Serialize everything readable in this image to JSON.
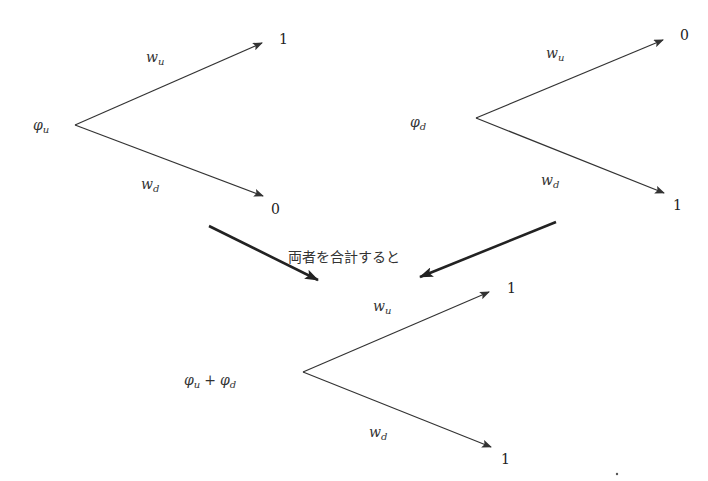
{
  "diagram": {
    "type": "binomial-tree-sum",
    "trees": [
      {
        "id": "tree-phi-u",
        "root_label": "φ",
        "root_sub": "u",
        "up_weight": "w",
        "up_weight_sub": "u",
        "down_weight": "w",
        "down_weight_sub": "d",
        "up_value": "1",
        "down_value": "0"
      },
      {
        "id": "tree-phi-d",
        "root_label": "φ",
        "root_sub": "d",
        "up_weight": "w",
        "up_weight_sub": "u",
        "down_weight": "w",
        "down_weight_sub": "d",
        "up_value": "0",
        "down_value": "1"
      },
      {
        "id": "tree-sum",
        "root_label_a": "φ",
        "root_sub_a": "u",
        "root_plus": "+",
        "root_label_b": "φ",
        "root_sub_b": "d",
        "up_weight": "w",
        "up_weight_sub": "u",
        "down_weight": "w",
        "down_weight_sub": "d",
        "up_value": "1",
        "down_value": "1"
      }
    ],
    "combine_caption": "両者を合計すると",
    "colors": {
      "line": "#333333",
      "bold_arrow": "#222222",
      "text": "#333333",
      "background": "#ffffff"
    }
  }
}
